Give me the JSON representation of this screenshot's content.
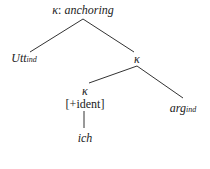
{
  "tree": {
    "root": {
      "symbol": "κ",
      "sep": ": ",
      "label": "anchoring"
    },
    "left_leaf": {
      "base": "Utt",
      "sub": "ind"
    },
    "mid": {
      "symbol": "κ"
    },
    "lower": {
      "symbol": "κ",
      "feature": "[+ident]",
      "leaf": "ich"
    },
    "right_leaf": {
      "base": "arg",
      "sub": "ind"
    }
  },
  "colors": {
    "line": "#333333",
    "text": "#222222",
    "background": "#ffffff"
  }
}
